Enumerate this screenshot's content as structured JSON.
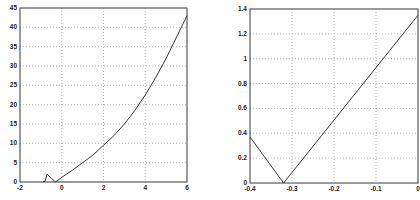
{
  "chart_data": [
    {
      "type": "line",
      "title": "",
      "xlabel": "",
      "ylabel": "",
      "xlim": [
        -2,
        6
      ],
      "ylim": [
        0,
        45
      ],
      "grid": true,
      "x_ticks": [
        -2,
        0,
        2,
        4,
        6
      ],
      "y_ticks": [
        0,
        5,
        10,
        15,
        20,
        25,
        30,
        35,
        40,
        45
      ],
      "x_tick_labels": [
        "-2",
        "0",
        "2",
        "4",
        "6"
      ],
      "y_tick_labels": [
        "0",
        "5",
        "10",
        "15",
        "20",
        "25",
        "30",
        "35",
        "40",
        "45"
      ],
      "series": [
        {
          "name": "curve",
          "x": [
            -0.9,
            -0.8,
            -0.7,
            -0.5,
            -0.3,
            0,
            0.5,
            1,
            1.5,
            2,
            2.5,
            3,
            3.5,
            4,
            4.5,
            5,
            5.5,
            6
          ],
          "y": [
            0,
            0.2,
            2,
            1.0,
            0,
            1.2,
            3,
            5,
            7,
            9.5,
            12,
            15,
            18.5,
            22.5,
            27,
            32,
            37.5,
            43
          ]
        }
      ]
    },
    {
      "type": "line",
      "title": "",
      "xlabel": "",
      "ylabel": "",
      "xlim": [
        -0.4,
        0
      ],
      "ylim": [
        0,
        1.4
      ],
      "grid": true,
      "x_ticks": [
        -0.4,
        -0.3,
        -0.2,
        -0.1,
        0
      ],
      "y_ticks": [
        0,
        0.2,
        0.4,
        0.6,
        0.8,
        1,
        1.2,
        1.4
      ],
      "x_tick_labels": [
        "-0.4",
        "-0.3",
        "-0.2",
        "-0.1",
        "0"
      ],
      "y_tick_labels": [
        "0",
        "0.2",
        "0.4",
        "0.6",
        "0.8",
        "1",
        "1.2",
        "1.4"
      ],
      "series": [
        {
          "name": "curve",
          "x": [
            -0.4,
            -0.32,
            0
          ],
          "y": [
            0.37,
            0,
            1.35
          ]
        }
      ]
    }
  ]
}
